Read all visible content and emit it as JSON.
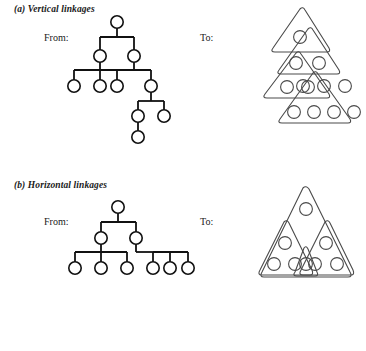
{
  "figure": {
    "background_color": "#ffffff",
    "line_color": "#111111",
    "outline_color": "#4a4a4a"
  },
  "panels": [
    {
      "id": "a",
      "caption": "(a)  Vertical linkages",
      "from_label": "From:",
      "to_label": "To:",
      "from_diagram": {
        "type": "node-link-tree",
        "description": "Unbalanced hierarchy of circular nodes joined by orthogonal links",
        "node_count": 10,
        "levels": 5
      },
      "to_diagram": {
        "type": "nested-triangles",
        "description": "Four overlapping rounded triangles cascading downward, each enclosing one more circle than the one above",
        "triangles": [
          {
            "index": 1,
            "circles": 1
          },
          {
            "index": 2,
            "circles": 2
          },
          {
            "index": 3,
            "circles": 3
          },
          {
            "index": 4,
            "circles": 4
          }
        ]
      }
    },
    {
      "id": "b",
      "caption": "(b)  Horizontal linkages",
      "from_label": "From:",
      "to_label": "To:",
      "from_diagram": {
        "type": "node-link-tree",
        "description": "Balanced hierarchy: one root, two middle nodes, six leaf nodes",
        "node_count": 9,
        "levels": 3
      },
      "to_diagram": {
        "type": "overlapping-triangles",
        "description": "One large triangle enclosing an apex circle, two medium triangles each enclosing three circles, and one small triangle around the centre-bottom circle",
        "triangles": [
          {
            "index": 1,
            "size": "large",
            "circles": 1
          },
          {
            "index": 2,
            "size": "medium",
            "circles": 3
          },
          {
            "index": 3,
            "size": "medium",
            "circles": 3
          },
          {
            "index": 4,
            "size": "small",
            "circles": 1
          }
        ]
      }
    }
  ]
}
